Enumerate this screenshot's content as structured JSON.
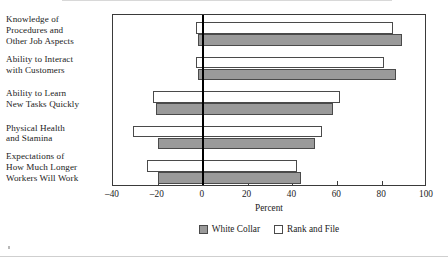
{
  "chart_data": {
    "type": "bar",
    "orientation": "horizontal",
    "title": "",
    "subtitle": "",
    "xlabel": "Percent",
    "ylabel": "",
    "xlim": [
      -40,
      100
    ],
    "xticks": [
      -40,
      -20,
      0,
      20,
      40,
      60,
      80,
      100
    ],
    "xtick_labels": [
      "–40",
      "–20",
      "0",
      "20",
      "40",
      "60",
      "80",
      "100"
    ],
    "grid": false,
    "zero_line": true,
    "legend_position": "bottom",
    "categories": [
      "Knowledge of Procedures and Other Job Aspects",
      "Ability to Interact with Customers",
      "Ability to Learn New Tasks Quickly",
      "Physical Health and Stamina",
      "Expectations of How Much Longer Workers Will Work"
    ],
    "series": [
      {
        "name": "White Collar",
        "color": "#9a9a9a",
        "positive_values": [
          89,
          86,
          58,
          50,
          44
        ],
        "negative_values": [
          -2,
          -2,
          -21,
          -20,
          -20
        ]
      },
      {
        "name": "Rank and File",
        "color": "#ffffff",
        "positive_values": [
          85,
          81,
          61,
          53,
          42
        ],
        "negative_values": [
          -3,
          -3,
          -22,
          -31,
          -25
        ]
      }
    ]
  },
  "labels": {
    "categories": [
      [
        "Knowledge of",
        "Procedures and",
        "Other Job Aspects"
      ],
      [
        "Ability to Interact",
        "with Customers"
      ],
      [
        "Ability to Learn",
        "New Tasks Quickly"
      ],
      [
        "Physical Health",
        "and Stamina"
      ],
      [
        "Expectations of",
        "How Much Longer",
        "Workers Will Work"
      ]
    ]
  },
  "legend": {
    "items": [
      {
        "label": "White Collar",
        "style": "filled-gray"
      },
      {
        "label": "Rank and File",
        "style": "outlined-white"
      }
    ]
  },
  "colors": {
    "white_collar_fill": "#9a9a9a",
    "rank_and_file_fill": "#ffffff",
    "bar_stroke": "#4a4a4a",
    "frame": "#3a3a3a",
    "zero_line": "#000000",
    "text": "#222222",
    "background": "#ffffff"
  }
}
